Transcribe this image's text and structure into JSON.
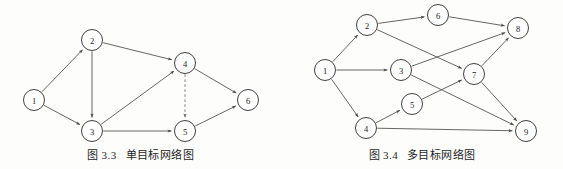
{
  "page": {
    "width": 563,
    "height": 169,
    "background_color": "#fdfdfc",
    "ink_color": "#2b2b2b",
    "edge_color": "#4a4a4a",
    "dashed_edge_color": "#6a6a6a"
  },
  "figures": [
    {
      "id": "figure-left",
      "caption_number": "图 3.3",
      "caption_title": "单目标网络图",
      "node_radius": 10.5,
      "nodes": [
        {
          "id": "1",
          "label": "1",
          "cx": 34,
          "cy": 100
        },
        {
          "id": "2",
          "label": "2",
          "cx": 92,
          "cy": 40
        },
        {
          "id": "3",
          "label": "3",
          "cx": 92,
          "cy": 131
        },
        {
          "id": "4",
          "label": "4",
          "cx": 185,
          "cy": 63
        },
        {
          "id": "5",
          "label": "5",
          "cx": 185,
          "cy": 131
        },
        {
          "id": "6",
          "label": "6",
          "cx": 248,
          "cy": 100
        }
      ],
      "edges": [
        {
          "from": "1",
          "to": "2",
          "style": "solid"
        },
        {
          "from": "1",
          "to": "3",
          "style": "solid"
        },
        {
          "from": "2",
          "to": "3",
          "style": "solid"
        },
        {
          "from": "2",
          "to": "4",
          "style": "solid"
        },
        {
          "from": "3",
          "to": "4",
          "style": "solid"
        },
        {
          "from": "3",
          "to": "5",
          "style": "solid"
        },
        {
          "from": "4",
          "to": "5",
          "style": "dashed"
        },
        {
          "from": "4",
          "to": "6",
          "style": "solid"
        },
        {
          "from": "5",
          "to": "6",
          "style": "solid"
        }
      ]
    },
    {
      "id": "figure-right",
      "caption_number": "图 3.4",
      "caption_title": "多目标网络图",
      "node_radius": 10.5,
      "nodes": [
        {
          "id": "1",
          "label": "1",
          "cx": 44,
          "cy": 70
        },
        {
          "id": "2",
          "label": "2",
          "cx": 86,
          "cy": 25
        },
        {
          "id": "3",
          "label": "3",
          "cx": 120,
          "cy": 70
        },
        {
          "id": "4",
          "label": "4",
          "cx": 85,
          "cy": 128
        },
        {
          "id": "5",
          "label": "5",
          "cx": 131,
          "cy": 104
        },
        {
          "id": "6",
          "label": "6",
          "cx": 157,
          "cy": 15
        },
        {
          "id": "7",
          "label": "7",
          "cx": 193,
          "cy": 74
        },
        {
          "id": "8",
          "label": "8",
          "cx": 237,
          "cy": 28
        },
        {
          "id": "9",
          "label": "9",
          "cx": 245,
          "cy": 131
        }
      ],
      "edges": [
        {
          "from": "1",
          "to": "2",
          "style": "solid"
        },
        {
          "from": "1",
          "to": "3",
          "style": "solid"
        },
        {
          "from": "1",
          "to": "4",
          "style": "solid"
        },
        {
          "from": "2",
          "to": "6",
          "style": "solid"
        },
        {
          "from": "2",
          "to": "7",
          "style": "solid"
        },
        {
          "from": "3",
          "to": "8",
          "style": "solid"
        },
        {
          "from": "3",
          "to": "9",
          "style": "solid"
        },
        {
          "from": "4",
          "to": "5",
          "style": "solid"
        },
        {
          "from": "4",
          "to": "9",
          "style": "solid"
        },
        {
          "from": "5",
          "to": "7",
          "style": "solid"
        },
        {
          "from": "6",
          "to": "8",
          "style": "solid"
        },
        {
          "from": "7",
          "to": "8",
          "style": "solid"
        },
        {
          "from": "7",
          "to": "9",
          "style": "solid"
        }
      ]
    }
  ]
}
